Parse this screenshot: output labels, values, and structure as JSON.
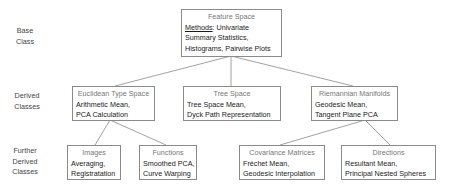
{
  "row_labels": {
    "base": [
      "Base",
      "Class"
    ],
    "derived": [
      "Derived",
      "Classes"
    ],
    "further": [
      "Further",
      "Derived",
      "Classes"
    ]
  },
  "base_node": {
    "title": "Feature Space",
    "methods_label": "Methods",
    "lines": [
      ": Univariate",
      "Summary Statistics,",
      "Histograms, Pairwise Plots"
    ]
  },
  "derived_nodes": [
    {
      "title": "Euclidean Type Space",
      "lines": [
        "Arithmetic Mean,",
        "PCA Calculation"
      ]
    },
    {
      "title": "Tree Space",
      "lines": [
        "Tree Space Mean,",
        "Dyck Path Representation"
      ]
    },
    {
      "title": "Riemannian Manifolds",
      "lines": [
        "Geodesic Mean,",
        "Tangent Plane PCA"
      ]
    }
  ],
  "further_nodes": [
    {
      "title": "Images",
      "lines": [
        "Averaging,",
        "Registratation"
      ],
      "parent": "Euclidean Type Space"
    },
    {
      "title": "Functions",
      "lines": [
        "Smoothed PCA,",
        "Curve Warping"
      ],
      "parent": "Euclidean Type Space"
    },
    {
      "title": "Covariance Matrices",
      "lines": [
        "Fréchet Mean,",
        "Geodesic Interpolation"
      ],
      "parent": "Riemannian Manifolds"
    },
    {
      "title": "Directions",
      "lines": [
        "Resultant Mean,",
        "Principal Nested Spheres"
      ],
      "parent": "Riemannian Manifolds"
    }
  ],
  "colors": {
    "border": "#8a8a8a",
    "connector": "#7a7a7a",
    "title_text": "#777777",
    "body_text": "#1a1a1a"
  }
}
